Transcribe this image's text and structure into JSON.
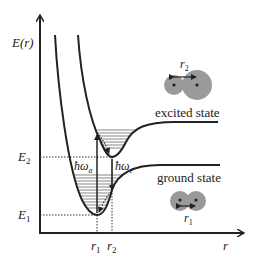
{
  "diagram": {
    "type": "potential-energy-curves",
    "y_axis_label": "E(r)",
    "x_axis_label": "r",
    "energy_levels": [
      {
        "label": "E",
        "sub": "2",
        "y": 157
      },
      {
        "label": "E",
        "sub": "1",
        "y": 215
      }
    ],
    "distances": [
      {
        "label": "r",
        "sub": "1",
        "x": 97
      },
      {
        "label": "r",
        "sub": "2",
        "x": 112
      }
    ],
    "transitions": {
      "absorption": {
        "label": "ħω",
        "sub": "a"
      },
      "emission": {
        "label": "ħω",
        "sub": "e"
      }
    },
    "states": {
      "excited": {
        "label": "excited state",
        "bond_label": "r",
        "bond_sub": "2"
      },
      "ground": {
        "label": "ground state",
        "bond_label": "r",
        "bond_sub": "1"
      }
    },
    "colors": {
      "line": "#222222",
      "atom_fill": "#9a9a9a",
      "dotted": "#333333"
    }
  }
}
